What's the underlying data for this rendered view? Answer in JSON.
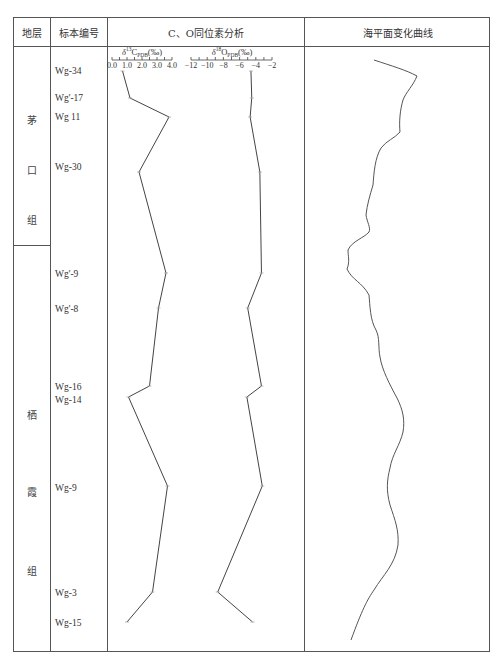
{
  "header": {
    "col_stratum": "地层",
    "col_sample": "标本编号",
    "col_isotope": "C、O同位素分析",
    "col_sealevel": "海平面变化曲线"
  },
  "formations": [
    {
      "name": "茅口组",
      "chars": [
        "茅",
        "口",
        "组"
      ]
    },
    {
      "name": "栖霞组",
      "chars": [
        "栖",
        "霞",
        "组"
      ]
    }
  ],
  "samples": [
    {
      "id": "Wg-34"
    },
    {
      "id": "Wg'-17"
    },
    {
      "id": "Wg 11"
    },
    {
      "id": "Wg-30"
    },
    {
      "id": "Wg'-9"
    },
    {
      "id": "Wg'-8"
    },
    {
      "id": "Wg-16"
    },
    {
      "id": "Wg-14"
    },
    {
      "id": "Wg-9"
    },
    {
      "id": "Wg-3"
    },
    {
      "id": "Wg-15"
    }
  ],
  "axes": {
    "carbon": {
      "label": "δ13C PDB(‰)",
      "label_main": "δ",
      "label_sup": "13",
      "label_rest": "C",
      "label_sub": "PDB",
      "label_unit": "(‰)",
      "ticks": [
        "0.0",
        "1.0",
        "2.0",
        "3.0",
        "4.0"
      ]
    },
    "oxygen": {
      "label": "δ18O PDB(‰)",
      "label_main": "δ",
      "label_sup": "18",
      "label_rest": "O",
      "label_sub": "PDB",
      "label_unit": "(‰)",
      "ticks": [
        "−12",
        "−10",
        "−8",
        "−6",
        "−4",
        "−2"
      ]
    }
  },
  "chart_data": [
    {
      "type": "line",
      "title": "δ13C PDB (‰)",
      "xlabel": "δ13C PDB (‰)",
      "ylabel": "Sample (stratigraphic order, top to bottom)",
      "xlim": [
        0.0,
        4.0
      ],
      "xticks": [
        0.0,
        1.0,
        2.0,
        3.0,
        4.0
      ],
      "orientation": "vertical-profile",
      "categories": [
        "Wg-34",
        "Wg'-17",
        "Wg 11",
        "Wg-30",
        "Wg'-9",
        "Wg'-8",
        "Wg-16",
        "Wg-14",
        "Wg-9",
        "Wg-3",
        "Wg-15"
      ],
      "values": [
        0.7,
        1.2,
        3.8,
        1.8,
        3.6,
        3.1,
        2.5,
        1.1,
        3.7,
        2.7,
        1.0
      ]
    },
    {
      "type": "line",
      "title": "δ18O PDB (‰)",
      "xlabel": "δ18O PDB (‰)",
      "ylabel": "Sample (stratigraphic order, top to bottom)",
      "xlim": [
        -12,
        -2
      ],
      "xticks": [
        -12,
        -10,
        -8,
        -6,
        -4,
        -2
      ],
      "orientation": "vertical-profile",
      "categories": [
        "Wg-34",
        "Wg'-17",
        "Wg 11",
        "Wg-30",
        "Wg'-9",
        "Wg'-8",
        "Wg-16",
        "Wg-14",
        "Wg-9",
        "Wg-3",
        "Wg-15"
      ],
      "values": [
        -4.6,
        -4.5,
        -4.7,
        -3.5,
        -3.3,
        -5.0,
        -3.3,
        -5.1,
        -3.2,
        -8.7,
        -4.4
      ]
    },
    {
      "type": "line",
      "title": "海平面变化曲线",
      "orientation": "vertical-profile",
      "note": "Qualitative sea-level curve, no axis ticks; right = higher sea level",
      "legend": []
    }
  ]
}
